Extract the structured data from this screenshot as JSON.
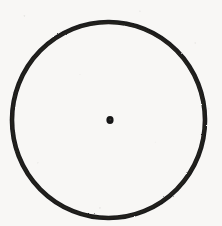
{
  "document": {
    "title": "Scanned geometric figure",
    "medium": "scanned paper",
    "background_color": "#f8f7f5",
    "ink_color": "#1a1a1a",
    "width": 222,
    "height": 226
  },
  "figure": {
    "name": "circle-with-center-point",
    "shapes": [
      {
        "id": "outer-circle",
        "type": "circle",
        "role": "circumference",
        "stroke_color": "#1a1a1a",
        "fill": "none",
        "stroke_width": 4.6,
        "center_x": 108.5,
        "center_y": 120,
        "radius_x": 96.5,
        "radius_y": 98,
        "bounds": {
          "left": 12,
          "top": 22,
          "right": 205,
          "bottom": 218
        }
      },
      {
        "id": "center-point",
        "type": "dot",
        "role": "center-marker",
        "fill_color": "#141414",
        "center_x": 110,
        "center_y": 120,
        "radius_x": 3.6,
        "radius_y": 4.0
      }
    ],
    "labels": []
  }
}
